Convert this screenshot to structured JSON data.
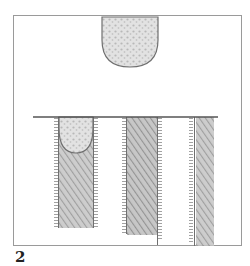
{
  "figure": {
    "label": "2",
    "colors": {
      "frame": "#8a8a8a",
      "stroke": "#6f6f6f",
      "fill_light": "#d6d6d6",
      "fill_dark": "#9a9a9a",
      "background": "#ffffff"
    },
    "elements": [
      {
        "name": "top-shield",
        "x": 102,
        "y": 16,
        "width": 56,
        "height": 51
      },
      {
        "name": "baseline",
        "x1": 33,
        "x2": 218,
        "y": 117
      },
      {
        "name": "column-1",
        "x": 57,
        "width": 38,
        "top": 117,
        "bottom": 228
      },
      {
        "name": "column-2",
        "x": 125,
        "width": 34,
        "top": 117,
        "bottom": 240
      },
      {
        "name": "column-3",
        "x": 192,
        "width": 20,
        "top": 117,
        "bottom": 246
      }
    ]
  }
}
